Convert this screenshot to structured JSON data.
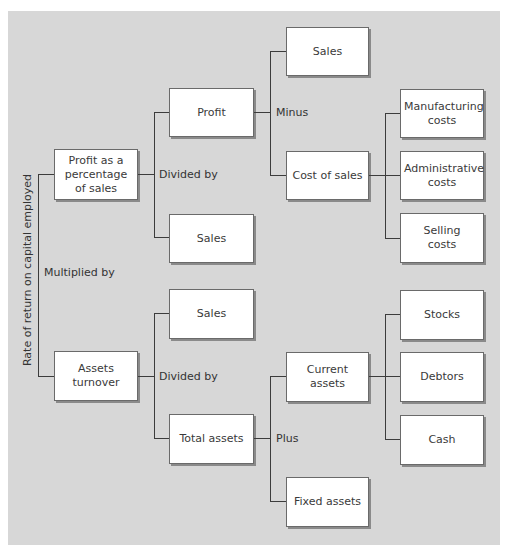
{
  "diagram": {
    "root_label": "Rate of return on capital employed",
    "root_operator": "Multiplied by",
    "nodes": {
      "profit_pct": "Profit as a percentage of sales",
      "profit": "Profit",
      "sales_a": "Sales",
      "sales_top": "Sales",
      "cost_of_sales": "Cost of sales",
      "manufacturing": "Manufacturing costs",
      "administrative": "Administrative costs",
      "selling": "Selling costs",
      "assets_turnover": "Assets turnover",
      "sales_b": "Sales",
      "total_assets": "Total assets",
      "current_assets": "Current assets",
      "fixed_assets": "Fixed assets",
      "stocks": "Stocks",
      "debtors": "Debtors",
      "cash": "Cash"
    },
    "operators": {
      "profit_pct_op": "Divided by",
      "profit_op": "Minus",
      "assets_turnover_op": "Divided by",
      "total_assets_op": "Plus"
    },
    "colors": {
      "background": "#d7d7d7",
      "box": "#ffffff",
      "line": "#3c3c3c"
    }
  }
}
